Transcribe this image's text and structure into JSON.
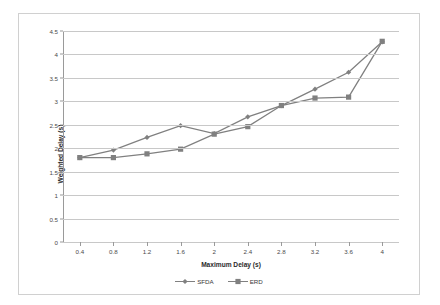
{
  "chart_data": {
    "type": "line",
    "title": "",
    "xlabel": "Maximum Delay (s)",
    "ylabel": "Weighted Delay (s)",
    "x": [
      0.4,
      0.8,
      1.2,
      1.6,
      2,
      2.4,
      2.8,
      3.2,
      3.6,
      4
    ],
    "xticklabels": [
      "0.4",
      "0.8",
      "1.2",
      "1.6",
      "2",
      "2.4",
      "2.8",
      "3.2",
      "3.6",
      "4"
    ],
    "yticklabels": [
      "0",
      "0.5",
      "1",
      "1.5",
      "2",
      "2.5",
      "3",
      "3.5",
      "4",
      "4.5"
    ],
    "yticks": [
      0,
      0.5,
      1,
      1.5,
      2,
      2.5,
      3,
      3.5,
      4,
      4.5
    ],
    "ylim": [
      0,
      4.5
    ],
    "xlim": [
      0.2,
      4.2
    ],
    "grid": "horizontal",
    "legend_position": "bottom-center",
    "series": [
      {
        "name": "SFDA",
        "marker": "diamond",
        "color": "#808080",
        "values": [
          1.8,
          1.96,
          2.23,
          2.48,
          2.31,
          2.67,
          2.91,
          3.26,
          3.62,
          4.27
        ]
      },
      {
        "name": "ERD",
        "marker": "square",
        "color": "#808080",
        "values": [
          1.8,
          1.8,
          1.88,
          1.98,
          2.3,
          2.46,
          2.91,
          3.07,
          3.09,
          4.28
        ]
      }
    ]
  },
  "legend": {
    "items": [
      {
        "label": "SFDA"
      },
      {
        "label": "ERD"
      }
    ]
  },
  "axes": {
    "x_title": "Maximum Delay (s)",
    "y_title": "Weighted Delay (s)"
  },
  "colors": {
    "series": "#808080",
    "gridline": "#c8c8c8",
    "axis": "#9a9a9a",
    "border": "#d0d0d0",
    "background": "#ffffff",
    "tick_text": "#4a4a4a"
  }
}
